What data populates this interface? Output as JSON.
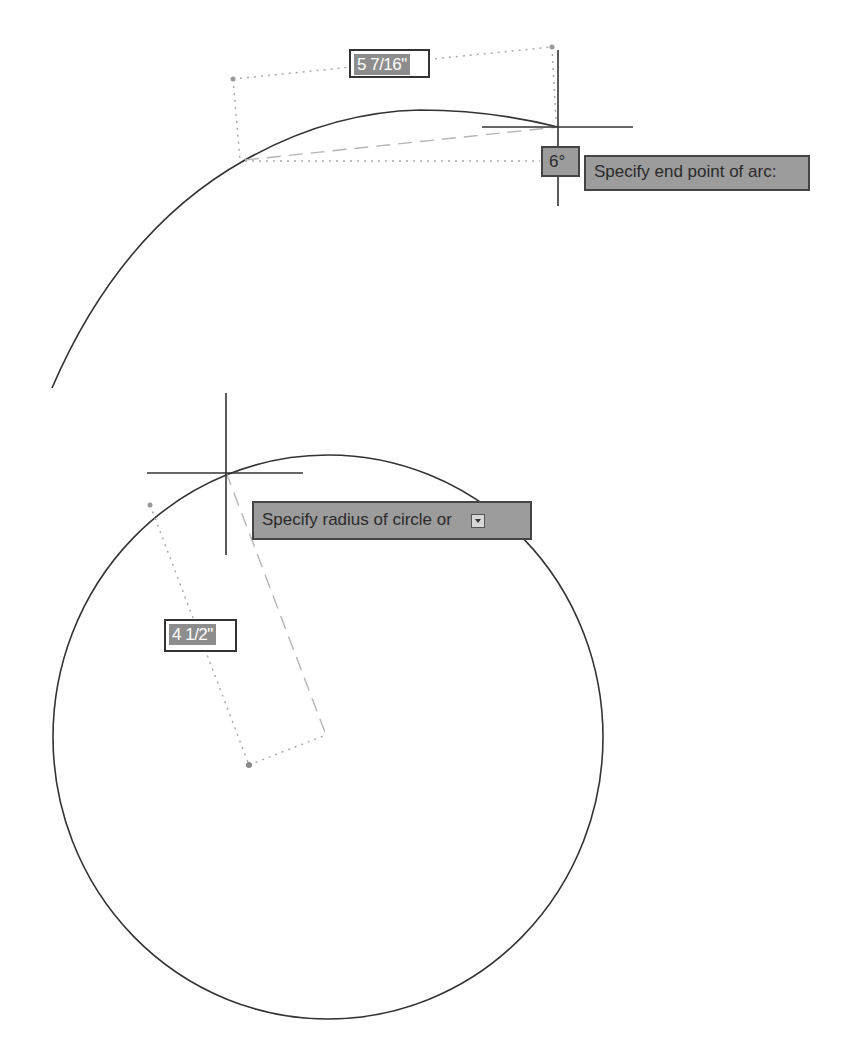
{
  "arc_view": {
    "linear_dimension": "5 7/16\"",
    "angle_dimension": "6°",
    "prompt": "Specify end point of arc:"
  },
  "circle_view": {
    "radius_dimension": "4 1/2\"",
    "prompt": "Specify radius of circle or",
    "options_button_icon": "dropdown-arrow-icon"
  },
  "colors": {
    "background": "#ffffff",
    "geometry_line": "#333333",
    "tooltip_fill": "#9c9c9c",
    "tooltip_border": "#444444",
    "dimension_value_fill": "#8d8d8d",
    "guide_line": "#aaaaaa"
  }
}
